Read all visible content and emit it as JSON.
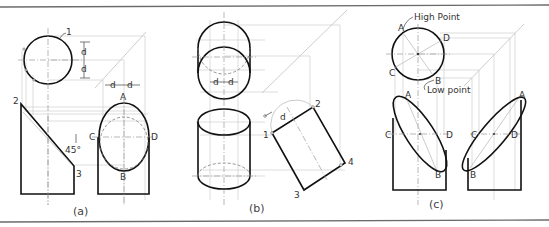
{
  "figure": {
    "colors": {
      "visible_line": "#111111",
      "construction_line": "#c0c0c0",
      "frame": "#6a6a6a",
      "label": "#333333"
    }
  },
  "panel_a": {
    "caption": "(a)",
    "labels": {
      "point_1": "1",
      "point_2": "2",
      "point_3": "3",
      "angle": "45°",
      "dim_d_vertical_top": "d",
      "dim_d_vertical_bottom": "d",
      "dim_d_horizontal_left": "d",
      "dim_d_horizontal_right": "d",
      "point_A": "A",
      "point_B": "B",
      "point_C": "C",
      "point_D": "D"
    }
  },
  "panel_b": {
    "caption": "(b)",
    "labels": {
      "dim_d_left": "d",
      "dim_d_right": "d",
      "dim_d_rotated": "d",
      "point_1": "1",
      "point_2": "2",
      "point_3": "3",
      "point_4": "4"
    }
  },
  "panel_c": {
    "caption": "(c)",
    "labels": {
      "high_point": "High Point",
      "low_point": "Low point",
      "top_A": "A",
      "top_B": "B",
      "top_C": "C",
      "top_D": "D",
      "front_left_A": "A",
      "front_left_B": "B",
      "front_left_C": "C",
      "front_left_D": "D",
      "front_right_A": "A",
      "front_right_B": "B",
      "front_right_C": "C",
      "front_right_D": "D"
    }
  }
}
